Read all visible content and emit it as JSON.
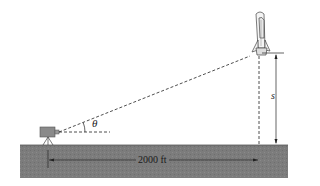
{
  "diagram": {
    "labels": {
      "angle": "θ",
      "height": "s",
      "distance": "2000 ft"
    },
    "elements": {
      "camera": "camera-on-tripod",
      "rocket": "space-shuttle-launch",
      "ground": "ground-block"
    },
    "colors": {
      "ground": "#7c7c7c",
      "camera": "#8a8a8a",
      "lines": "#222222"
    }
  }
}
